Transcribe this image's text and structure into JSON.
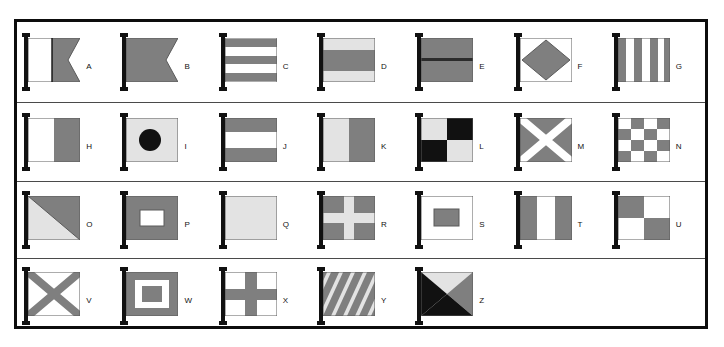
{
  "chart_data": {
    "type": "table",
    "colors": {
      "white": "#ffffff",
      "light": "#e3e3e3",
      "gray": "#7f7f7f",
      "black": "#111111",
      "outline": "#5a5a5a",
      "frame": "#0d0d0d",
      "divider": "#4a4a4a",
      "page_background": "#ffffff"
    },
    "layout": {
      "rows": 4,
      "columns": 7,
      "grid": "on",
      "legend": "none",
      "frame": "thick black rectangle",
      "row_dividers": "thin dark gray horizontal rules"
    },
    "categories": [
      "A",
      "B",
      "C",
      "D",
      "E",
      "F",
      "G",
      "H",
      "I",
      "J",
      "K",
      "L",
      "M",
      "N",
      "O",
      "P",
      "Q",
      "R",
      "S",
      "T",
      "U",
      "V",
      "W",
      "X",
      "Y",
      "Z"
    ],
    "count": 26
  },
  "sheet": {
    "rows": [
      {
        "row_label": "row-1",
        "flags": [
          {
            "letter": "A",
            "design": "swallowtail-vertical-halves",
            "notes": "white hoist half, gray fly half, swallowtail notch"
          },
          {
            "letter": "B",
            "design": "swallowtail-solid",
            "notes": "solid gray swallowtail"
          },
          {
            "letter": "C",
            "design": "horizontal-five-stripes",
            "notes": "gray, white, gray, white, gray horizontal bands"
          },
          {
            "letter": "D",
            "design": "horizontal-three-bands",
            "notes": "light, gray, light horizontal bands"
          },
          {
            "letter": "E",
            "design": "horizontal-two-bands-line",
            "notes": "gray over gray split by dark line"
          },
          {
            "letter": "F",
            "design": "diamond",
            "notes": "gray diamond on white field"
          },
          {
            "letter": "G",
            "design": "vertical-six-stripes",
            "notes": "alternating gray and white vertical stripes"
          }
        ]
      },
      {
        "row_label": "row-2",
        "flags": [
          {
            "letter": "H",
            "design": "vertical-halves",
            "notes": "white hoist, gray fly"
          },
          {
            "letter": "I",
            "design": "circle-centered",
            "notes": "black disc on light field"
          },
          {
            "letter": "J",
            "design": "horizontal-three-bands",
            "notes": "gray, white, gray"
          },
          {
            "letter": "K",
            "design": "vertical-halves",
            "notes": "light hoist, gray fly"
          },
          {
            "letter": "L",
            "design": "quartered",
            "notes": "light and black quarters, light top-left"
          },
          {
            "letter": "M",
            "design": "saltire",
            "notes": "white diagonal cross on gray"
          },
          {
            "letter": "N",
            "design": "checkerboard",
            "notes": "4 by 4 checkerboard of white and gray"
          }
        ]
      },
      {
        "row_label": "row-3",
        "flags": [
          {
            "letter": "O",
            "design": "diagonal-halves",
            "notes": "light upper-left triangle, gray lower-right"
          },
          {
            "letter": "P",
            "design": "rectangle-centered",
            "notes": "white rectangle on gray field"
          },
          {
            "letter": "Q",
            "design": "plain",
            "notes": "plain light field"
          },
          {
            "letter": "R",
            "design": "cross",
            "notes": "light cross on gray field"
          },
          {
            "letter": "S",
            "design": "rectangle-centered",
            "notes": "gray rectangle on white field"
          },
          {
            "letter": "T",
            "design": "vertical-three-bands",
            "notes": "gray, white, gray"
          },
          {
            "letter": "U",
            "design": "quartered",
            "notes": "gray top-left, white top-right, white bottom-left, gray bottom-right"
          }
        ]
      },
      {
        "row_label": "row-4",
        "flags": [
          {
            "letter": "V",
            "design": "saltire",
            "notes": "gray diagonal cross on white"
          },
          {
            "letter": "W",
            "design": "concentric-rectangles",
            "notes": "gray border, white ring, gray centre"
          },
          {
            "letter": "X",
            "design": "cross",
            "notes": "gray cross on white field"
          },
          {
            "letter": "Y",
            "design": "diagonal-stripes",
            "notes": "alternating gray and light diagonal stripes"
          },
          {
            "letter": "Z",
            "design": "quartered-triangles",
            "notes": "light top, black hoist, gray fly, black bottom"
          },
          {
            "letter": "",
            "design": "empty",
            "notes": "empty cell"
          },
          {
            "letter": "",
            "design": "empty",
            "notes": "empty cell"
          }
        ]
      }
    ]
  }
}
